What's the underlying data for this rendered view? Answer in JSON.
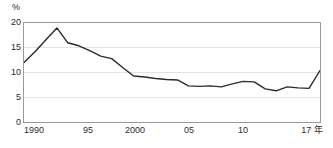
{
  "chart_data": {
    "type": "line",
    "title": "",
    "xlabel": "年",
    "ylabel": "%",
    "unit_label": "%",
    "x": [
      1990,
      1991,
      1992,
      1993,
      1994,
      1995,
      1996,
      1997,
      1998,
      1999,
      2000,
      2001,
      2002,
      2003,
      2004,
      2005,
      2006,
      2007,
      2008,
      2009,
      2010,
      2011,
      2012,
      2013,
      2014,
      2015,
      2016,
      2017
    ],
    "values": [
      12.0,
      14.2,
      16.6,
      19.0,
      16.0,
      15.4,
      14.4,
      13.3,
      12.8,
      11.0,
      9.3,
      9.1,
      8.8,
      8.6,
      8.5,
      7.3,
      7.2,
      7.3,
      7.1,
      7.7,
      8.2,
      8.1,
      6.7,
      6.3,
      7.1,
      6.9,
      6.8,
      10.4
    ],
    "series": [
      {
        "name": "値",
        "color": "#2b2b2b",
        "values": [
          12.0,
          14.2,
          16.6,
          19.0,
          16.0,
          15.4,
          14.4,
          13.3,
          12.8,
          11.0,
          9.3,
          9.1,
          8.8,
          8.6,
          8.5,
          7.3,
          7.2,
          7.3,
          7.1,
          7.7,
          8.2,
          8.1,
          6.7,
          6.3,
          7.1,
          6.9,
          6.8,
          10.4
        ]
      }
    ],
    "ylim": [
      0,
      20
    ],
    "xlim": [
      1990,
      2017
    ],
    "yticks": [
      0,
      5,
      10,
      15,
      20
    ],
    "ytick_labels": [
      "0",
      "5",
      "10",
      "15",
      "20"
    ],
    "xticks": [
      1990,
      1995,
      2000,
      2005,
      2010,
      2017
    ],
    "xtick_labels": [
      "1990",
      "95",
      "2000",
      "05",
      "10",
      "17 年"
    ],
    "grid": true,
    "grid_axis": "y",
    "legend": "none",
    "line_color": "#2b2b2b",
    "line_width": 1.4,
    "frame_color": "#9a9a9a",
    "grid_color": "#e2e2e2",
    "background": "#ffffff"
  }
}
